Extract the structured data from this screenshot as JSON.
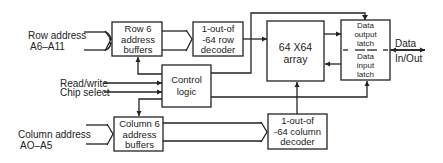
{
  "diagram": {
    "type": "block-diagram",
    "title": "",
    "colors": {
      "stroke": "#222222",
      "background": "#ffffff"
    },
    "inputs": {
      "row_address": {
        "line1": "Row address",
        "line2": "A6–A11"
      },
      "read_write": "Read/write",
      "chip_select": "Chip select",
      "column_address": {
        "line1": "Column address",
        "line2": "AO–A5"
      }
    },
    "blocks": {
      "row_buffers": {
        "line1": "Row  6",
        "line2": "address",
        "line3": "buffers"
      },
      "row_decoder": {
        "line1": "1-out-of",
        "line2": "-64 row",
        "line3": "decoder"
      },
      "array": {
        "line1": "64 X64",
        "line2": "array"
      },
      "output_latch": {
        "line1": "Data",
        "line2": "output",
        "line3": "latch"
      },
      "input_latch": {
        "line1": "Data",
        "line2": "input",
        "line3": "latch"
      },
      "control": {
        "line1": "Control",
        "line2": "logic"
      },
      "column_buffers": {
        "line1": "Column 6",
        "line2": "address",
        "line3": "buffers"
      },
      "column_decoder": {
        "line1": "1-out-of",
        "line2": "-64 column",
        "line3": "decoder"
      }
    },
    "outputs": {
      "data": {
        "line1": "Data",
        "line2": "In/Out"
      }
    },
    "connections": [
      {
        "from": "row_address",
        "to": "row_buffers",
        "bus_width": "6"
      },
      {
        "from": "row_buffers",
        "to": "row_decoder"
      },
      {
        "from": "row_decoder",
        "to": "array"
      },
      {
        "from": "array",
        "to": "output_latch"
      },
      {
        "from": "input_latch",
        "to": "array"
      },
      {
        "from": "output_latch",
        "to": "data",
        "bidirectional": true
      },
      {
        "from": "control",
        "to": "output_latch"
      },
      {
        "from": "control",
        "to": "input_latch"
      },
      {
        "from": "control",
        "to": "row_buffers"
      },
      {
        "from": "control",
        "to": "column_buffers"
      },
      {
        "from": "read_write",
        "to": "control"
      },
      {
        "from": "chip_select",
        "to": "control"
      },
      {
        "from": "column_address",
        "to": "column_buffers",
        "bus_width": "6"
      },
      {
        "from": "column_buffers",
        "to": "column_decoder"
      },
      {
        "from": "column_decoder",
        "to": "array"
      }
    ]
  }
}
